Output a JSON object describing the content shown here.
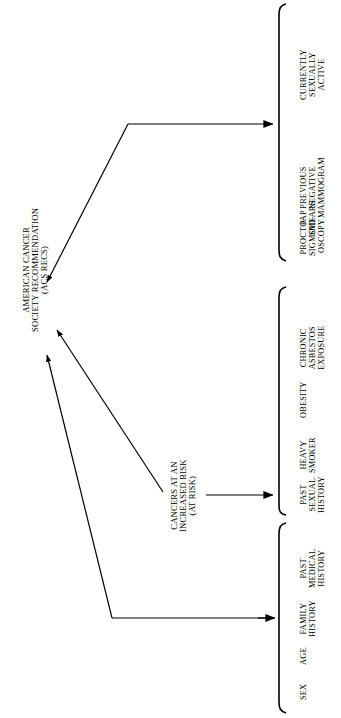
{
  "diagram": {
    "type": "flowchart-rotated",
    "orientation": "text rotated 90 degrees counter-clockwise",
    "root": {
      "id": "acs-recs",
      "lines": [
        "AMERICAN CANCER",
        "SOCIETY RECOMMENDATION",
        "(ACS RECS)"
      ]
    },
    "intermediate": {
      "id": "at-risk",
      "lines": [
        "CANCERS AT AN",
        "INCREASED RISK",
        "(AT RISK)"
      ]
    },
    "groups": [
      {
        "id": "screening-tests",
        "items": [
          {
            "lines": [
              "CURRENTLY",
              "SEXUALLY",
              "ACTIVE"
            ]
          },
          {
            "lines": [
              "PREVIOUS",
              "NEGATIVE",
              "MAMMOGRAM"
            ]
          },
          {
            "lines": [
              "PAP",
              "SMEARS"
            ]
          },
          {
            "lines": [
              "PROCTO-",
              "SIGMOID-",
              "OSCOPY"
            ]
          }
        ]
      },
      {
        "id": "risk-factors",
        "items": [
          {
            "lines": [
              "CHRONIC",
              "ASBESTOS",
              "EXPOSURE"
            ]
          },
          {
            "lines": [
              "OBESITY"
            ]
          },
          {
            "lines": [
              "HEAVY",
              "SMOKER"
            ]
          },
          {
            "lines": [
              "PAST",
              "SEXUAL",
              "HISTORY"
            ]
          }
        ]
      },
      {
        "id": "patient-attributes",
        "items": [
          {
            "lines": [
              "PAST",
              "MEDICAL",
              "HISTORY"
            ]
          },
          {
            "lines": [
              "FAMILY",
              "HISTORY"
            ]
          },
          {
            "lines": [
              "AGE"
            ]
          },
          {
            "lines": [
              "SEX"
            ]
          }
        ]
      }
    ],
    "colors": {
      "ink": "#000000",
      "background": "#ffffff"
    }
  }
}
